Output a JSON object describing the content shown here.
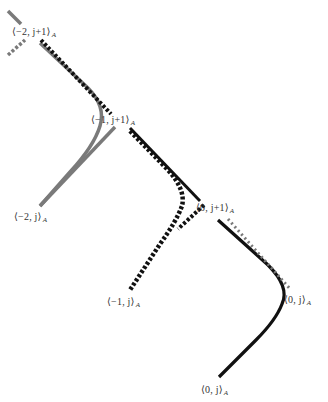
{
  "diagram": {
    "colors": {
      "gray": "#7a7a7a",
      "black": "#111111",
      "label": "#333333",
      "background": "#ffffff"
    },
    "labels": [
      {
        "id": "m2-j1",
        "text": "⟨−2, j+1⟩",
        "sub": "A"
      },
      {
        "id": "m1-j1",
        "text": "⟨−1, j+1⟩",
        "sub": "A"
      },
      {
        "id": "0-j1",
        "text": "⟨0, j+1⟩",
        "sub": "A"
      },
      {
        "id": "m2-j",
        "text": "⟨−2, j⟩",
        "sub": "A"
      },
      {
        "id": "m1-j",
        "text": "⟨−1, j⟩",
        "sub": "A"
      },
      {
        "id": "0-j-right",
        "text": "⟨0, j⟩",
        "sub": "A"
      },
      {
        "id": "0-j-bottom",
        "text": "⟨0, j⟩",
        "sub": "A"
      }
    ],
    "curves": [
      {
        "id": "gray-top-solid-stub",
        "style": "solid",
        "color": "gray"
      },
      {
        "id": "gray-top-dashed-stub",
        "style": "dashed",
        "color": "gray"
      },
      {
        "id": "gray-bend-curve",
        "style": "solid",
        "color": "gray"
      },
      {
        "id": "gray-straight-segment",
        "style": "solid",
        "color": "gray"
      },
      {
        "id": "black-dashed-upper-left",
        "style": "dashed",
        "color": "black"
      },
      {
        "id": "black-solid-middle",
        "style": "solid",
        "color": "black"
      },
      {
        "id": "black-dashed-bend-curve",
        "style": "dashed",
        "color": "black"
      },
      {
        "id": "black-solid-bend-curve",
        "style": "solid",
        "color": "black"
      },
      {
        "id": "gray-dashed-right",
        "style": "dashed",
        "color": "gray"
      }
    ]
  }
}
